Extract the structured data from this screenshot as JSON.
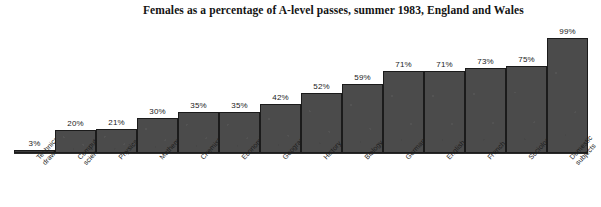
{
  "title": "Females as a percentage of A-level passes, summer 1983, England and Wales",
  "colors": {
    "bar_fill": "#4b4b4b",
    "bar_border": "#1b1b1b",
    "text": "#141414",
    "background": "#ffffff"
  },
  "chart_data": {
    "type": "bar",
    "title": "Females as a percentage of A-level passes, summer 1983, England and Wales",
    "xlabel": "",
    "ylabel": "",
    "ylim": [
      0,
      100
    ],
    "grid": false,
    "legend": false,
    "value_suffix": "%",
    "categories": [
      "Technical drawing",
      "Computer science",
      "Physics",
      "Mathematics",
      "Chemistry",
      "Economics",
      "Geography",
      "History",
      "Biology",
      "German",
      "English",
      "French",
      "Sociology",
      "Domestic subjects"
    ],
    "category_lines": [
      [
        "Technical",
        "drawing"
      ],
      [
        "Computer",
        "science"
      ],
      [
        "Physics"
      ],
      [
        "Mathematics"
      ],
      [
        "Chemistry"
      ],
      [
        "Economics"
      ],
      [
        "Geography"
      ],
      [
        "History"
      ],
      [
        "Biology"
      ],
      [
        "German"
      ],
      [
        "English"
      ],
      [
        "French"
      ],
      [
        "Sociology"
      ],
      [
        "Domestic",
        "subjects"
      ]
    ],
    "values": [
      3,
      20,
      21,
      30,
      35,
      35,
      42,
      52,
      59,
      71,
      71,
      73,
      75,
      99
    ],
    "value_labels": [
      "3%",
      "20%",
      "21%",
      "30%",
      "35%",
      "35%",
      "42%",
      "52%",
      "59%",
      "71%",
      "71%",
      "73%",
      "75%",
      "99%"
    ]
  }
}
